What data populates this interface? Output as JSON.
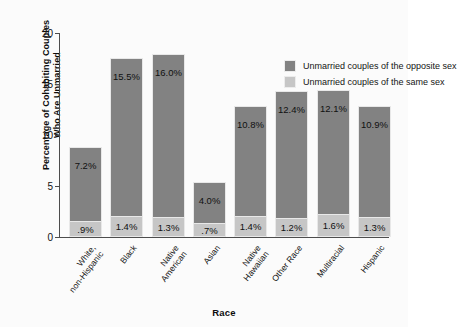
{
  "chart_data": {
    "type": "bar",
    "subtype": "stacked-bar",
    "title": "",
    "xlabel": "Race",
    "ylabel": "Percentage of Cohabiting Couples Who Are Unmarried",
    "ylabel_lines": [
      "Percentage of Cohabiting Couples",
      "Who Are Unmarried"
    ],
    "ylim": [
      0,
      20
    ],
    "ytick_labels": [
      "0",
      "5",
      "10",
      "15",
      "20"
    ],
    "ytick_values": [
      0,
      5,
      10,
      15,
      20
    ],
    "grid": false,
    "legend_position": "upper right inside plot",
    "categories": [
      "White, non-Hispanic",
      "Black",
      "Native American",
      "Asian",
      "Native Hawaiian",
      "Other Race",
      "Multiracial",
      "Hispanic"
    ],
    "category_lines": [
      [
        "White,",
        "non-Hispanic"
      ],
      [
        "Black"
      ],
      [
        "Native",
        "American"
      ],
      [
        "Asian"
      ],
      [
        "Native",
        "Hawaiian"
      ],
      [
        "Other Race"
      ],
      [
        "Multiracial"
      ],
      [
        "Hispanic"
      ]
    ],
    "series": [
      {
        "name": "Unmarried couples of the opposite sex",
        "color": "#828282",
        "values": [
          7.2,
          15.5,
          16.0,
          4.0,
          10.8,
          12.4,
          12.1,
          10.9
        ],
        "labels": [
          "7.2%",
          "15.5%",
          "16.0%",
          "4.0%",
          "10.8%",
          "12.4%",
          "12.1%",
          "10.9%"
        ]
      },
      {
        "name": "Unmarried couples of the same sex",
        "color": "#c6c6c6",
        "values": [
          0.9,
          1.4,
          1.3,
          0.7,
          1.4,
          1.2,
          1.6,
          1.3
        ],
        "labels": [
          ".9%",
          "1.4%",
          "1.3%",
          ".7%",
          "1.4%",
          "1.2%",
          "1.6%",
          "1.3%"
        ]
      }
    ]
  },
  "legend": {
    "items": [
      {
        "label": "Unmarried couples of the opposite sex",
        "color": "#828282"
      },
      {
        "label": "Unmarried couples of the same sex",
        "color": "#c6c6c6"
      }
    ]
  },
  "colors": {
    "opposite_sex": "#828282",
    "same_sex": "#c6c6c6",
    "axis": "#4d4d4d",
    "background": "#fbfbfb"
  }
}
